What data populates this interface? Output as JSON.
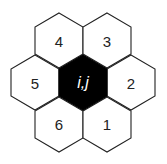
{
  "diagram": {
    "type": "hexagonal-neighborhood",
    "center": {
      "label": "i,j",
      "fill": "#000000",
      "text_color": "#ffffff"
    },
    "neighbors": [
      {
        "label": "1"
      },
      {
        "label": "2"
      },
      {
        "label": "3"
      },
      {
        "label": "4"
      },
      {
        "label": "5"
      },
      {
        "label": "6"
      }
    ],
    "stroke_color": "#222222",
    "neighbor_fill": "#ffffff"
  }
}
